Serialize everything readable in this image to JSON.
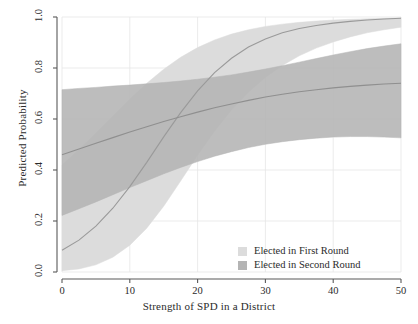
{
  "chart_data": {
    "type": "area",
    "title": "",
    "xlabel": "Strength of SPD in a District",
    "ylabel": "Predicted Probability",
    "xlim": [
      0,
      50
    ],
    "ylim": [
      0,
      1
    ],
    "xticks": [
      "0",
      "10",
      "20",
      "30",
      "40",
      "50"
    ],
    "xtick_values": [
      0,
      10,
      20,
      30,
      40,
      50
    ],
    "yticks": [
      "0.0",
      "0.2",
      "0.4",
      "0.6",
      "0.8",
      "1.0"
    ],
    "ytick_values": [
      0.0,
      0.2,
      0.4,
      0.6,
      0.8,
      1.0
    ],
    "grid": true,
    "legend_position": "bottom-right",
    "x": [
      0,
      2.5,
      5,
      7.5,
      10,
      12.5,
      15,
      17.5,
      20,
      22.5,
      25,
      27.5,
      30,
      32.5,
      35,
      37.5,
      40,
      42.5,
      45,
      47.5,
      50
    ],
    "series": [
      {
        "name": "Elected in First Round",
        "color": "#dcdcdc",
        "line_color": "#9a9a9a",
        "mean": [
          0.085,
          0.125,
          0.18,
          0.25,
          0.335,
          0.43,
          0.53,
          0.625,
          0.71,
          0.782,
          0.838,
          0.882,
          0.914,
          0.938,
          0.955,
          0.967,
          0.976,
          0.983,
          0.988,
          0.992,
          0.995
        ],
        "lower": [
          0.005,
          0.012,
          0.028,
          0.058,
          0.105,
          0.172,
          0.258,
          0.357,
          0.458,
          0.552,
          0.635,
          0.705,
          0.763,
          0.81,
          0.848,
          0.878,
          0.902,
          0.922,
          0.938,
          0.95,
          0.96
        ],
        "upper": [
          0.42,
          0.48,
          0.545,
          0.612,
          0.678,
          0.74,
          0.795,
          0.842,
          0.88,
          0.91,
          0.933,
          0.95,
          0.963,
          0.972,
          0.979,
          0.984,
          0.988,
          0.991,
          0.993,
          0.995,
          0.997
        ]
      },
      {
        "name": "Elected in Second Round",
        "color": "#b4b4b4",
        "line_color": "#8f8f8f",
        "mean": [
          0.46,
          0.482,
          0.505,
          0.527,
          0.549,
          0.57,
          0.59,
          0.609,
          0.627,
          0.644,
          0.659,
          0.673,
          0.686,
          0.697,
          0.707,
          0.715,
          0.722,
          0.728,
          0.733,
          0.737,
          0.74
        ],
        "lower": [
          0.222,
          0.248,
          0.275,
          0.303,
          0.331,
          0.358,
          0.385,
          0.41,
          0.433,
          0.454,
          0.472,
          0.488,
          0.501,
          0.511,
          0.519,
          0.525,
          0.529,
          0.531,
          0.531,
          0.529,
          0.526
        ],
        "upper": [
          0.715,
          0.72,
          0.724,
          0.729,
          0.733,
          0.738,
          0.743,
          0.749,
          0.756,
          0.764,
          0.773,
          0.784,
          0.796,
          0.809,
          0.823,
          0.837,
          0.851,
          0.864,
          0.876,
          0.886,
          0.895
        ]
      }
    ],
    "legend": [
      {
        "label": "Elected in First Round",
        "color": "#dcdcdc"
      },
      {
        "label": "Elected in Second Round",
        "color": "#b4b4b4"
      }
    ]
  }
}
